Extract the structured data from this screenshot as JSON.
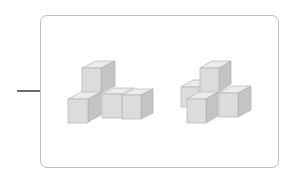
{
  "diagram": {
    "connector": {
      "color": "#6a6a6a"
    },
    "panel": {
      "border_color": "#bdbdbd"
    },
    "figures": [
      {
        "name": "left-cube-figure",
        "cube_count": 4,
        "description": "T-shaped arrangement of 4 cubes: one stacked on top at back, one in front-left, two in a row to the right"
      },
      {
        "name": "right-cube-figure",
        "cube_count": 5,
        "description": "Plus/cross-shaped arrangement of 5 cubes with one on top"
      }
    ],
    "colors": {
      "top_face": "#ececec",
      "front_face": "#dcdcdc",
      "side_face": "#c4c4c4",
      "edge": "#b5b5b5"
    }
  }
}
